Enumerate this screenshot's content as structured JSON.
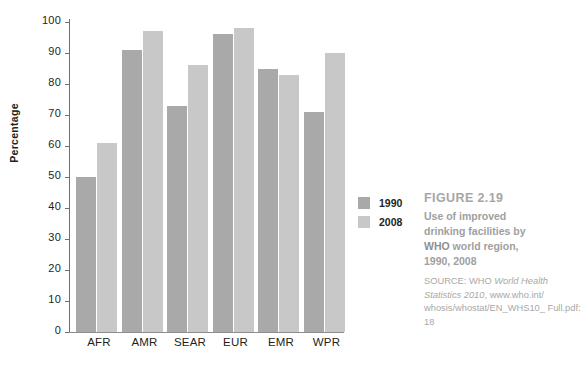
{
  "chart_data": {
    "type": "bar",
    "title": "Use of improved drinking facilities by WHO world region, 1990, 2008",
    "xlabel": "",
    "ylabel": "Percentage",
    "ylim": [
      0,
      100
    ],
    "ytick_labels": [
      "100",
      "90",
      "80",
      "70",
      "60",
      "50",
      "40",
      "30",
      "20",
      "10",
      "0"
    ],
    "yticks": [
      100,
      90,
      80,
      70,
      60,
      50,
      40,
      30,
      20,
      10,
      0
    ],
    "grid": false,
    "legend_position": "right",
    "categories": [
      "AFR",
      "AMR",
      "SEAR",
      "EUR",
      "EMR",
      "WPR"
    ],
    "series": [
      {
        "name": "1990",
        "color": "#a9a9a9",
        "values": [
          50,
          91,
          73,
          96,
          85,
          71
        ]
      },
      {
        "name": "2008",
        "color": "#c8c8c8",
        "values": [
          61,
          97,
          86,
          98,
          83,
          90
        ]
      }
    ]
  },
  "axis": {
    "y_title": "Percentage"
  },
  "legend": {
    "items": [
      {
        "label": "1990",
        "color": "#a9a9a9"
      },
      {
        "label": "2008",
        "color": "#c8c8c8"
      }
    ]
  },
  "caption": {
    "figure_label": "FIGURE 2.19",
    "line1": "Use of improved",
    "line2": "drinking facilities by",
    "line3_bold": "WHO",
    "line3_rest": " world region,",
    "line4": "1990, 2008",
    "source_prefix": "SOURCE: WHO ",
    "source_italic_1": "World Health",
    "source_italic_2": "Statistics 2010",
    "source_rest_1": ", www.who.int/",
    "source_rest_2": "whosis/whostat/EN_WHS10_",
    "source_rest_3": "Full.pdf: 18"
  }
}
